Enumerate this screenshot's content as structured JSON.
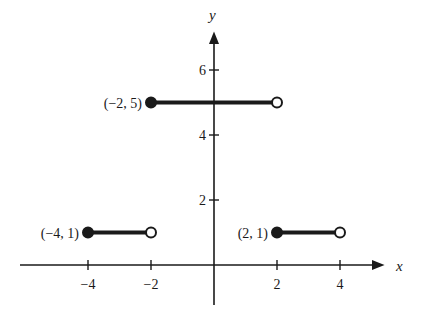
{
  "chart_data": {
    "type": "line",
    "title": "",
    "xlabel": "x",
    "ylabel": "y",
    "xlim": [
      -6.7,
      5.6
    ],
    "ylim": [
      -1.5,
      7.5
    ],
    "grid": false,
    "x_ticks": [
      -4,
      -2,
      2,
      4
    ],
    "x_tick_labels": [
      "−4",
      "−2",
      "2",
      "4"
    ],
    "y_ticks": [
      2,
      4,
      6
    ],
    "y_tick_labels": [
      "2",
      "4",
      "6"
    ],
    "series": [
      {
        "name": "segment-1",
        "x": [
          -4,
          -2
        ],
        "y": [
          1,
          1
        ],
        "start": "closed",
        "end": "open",
        "label": "(−4, 1)"
      },
      {
        "name": "segment-2",
        "x": [
          -2,
          2
        ],
        "y": [
          5,
          5
        ],
        "start": "closed",
        "end": "open",
        "label": "(−2, 5)"
      },
      {
        "name": "segment-3",
        "x": [
          2,
          4
        ],
        "y": [
          1,
          1
        ],
        "start": "closed",
        "end": "open",
        "label": "(2, 1)"
      }
    ]
  }
}
